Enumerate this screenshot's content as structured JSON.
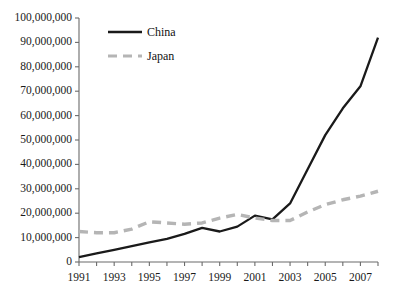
{
  "chart_data": {
    "type": "line",
    "title": "",
    "xlabel": "",
    "ylabel": "",
    "x": [
      1991,
      1992,
      1993,
      1994,
      1995,
      1996,
      1997,
      1998,
      1999,
      2000,
      2001,
      2002,
      2003,
      2004,
      2005,
      2006,
      2007,
      2008
    ],
    "xlim": [
      1991,
      2008
    ],
    "ylim": [
      0,
      100000000
    ],
    "ytick_values": [
      0,
      10000000,
      20000000,
      30000000,
      40000000,
      50000000,
      60000000,
      70000000,
      80000000,
      90000000,
      100000000
    ],
    "ytick_labels": [
      "0",
      "10,000,000",
      "20,000,000",
      "30,000,000",
      "40,000,000",
      "50,000,000",
      "60,000,000",
      "70,000,000",
      "80,000,000",
      "90,000,000",
      "100,000,000"
    ],
    "xtick_values": [
      1991,
      1992,
      1993,
      1994,
      1995,
      1996,
      1997,
      1998,
      1999,
      2000,
      2001,
      2002,
      2003,
      2004,
      2005,
      2006,
      2007,
      2008
    ],
    "xtick_labels": [
      "1991",
      "",
      "1993",
      "",
      "1995",
      "",
      "1997",
      "",
      "1999",
      "",
      "2001",
      "",
      "2003",
      "",
      "2005",
      "",
      "2007",
      ""
    ],
    "grid": false,
    "legend_position": "top-left-inside",
    "series": [
      {
        "name": "China",
        "color": "#1a1a1a",
        "style": "solid",
        "values": [
          2000000,
          3500000,
          5000000,
          6500000,
          8000000,
          9500000,
          11500000,
          14000000,
          12500000,
          14500000,
          19000000,
          17500000,
          24000000,
          38000000,
          52000000,
          63000000,
          72000000,
          92000000
        ]
      },
      {
        "name": "Japan",
        "color": "#b5b5b5",
        "style": "dashed",
        "values": [
          12500000,
          12000000,
          12000000,
          13500000,
          16500000,
          16000000,
          15500000,
          16000000,
          18000000,
          19500000,
          18000000,
          17000000,
          17000000,
          20500000,
          23500000,
          25500000,
          27000000,
          29000000
        ]
      }
    ]
  },
  "legend": {
    "items": [
      {
        "label": "China"
      },
      {
        "label": "Japan"
      }
    ]
  }
}
